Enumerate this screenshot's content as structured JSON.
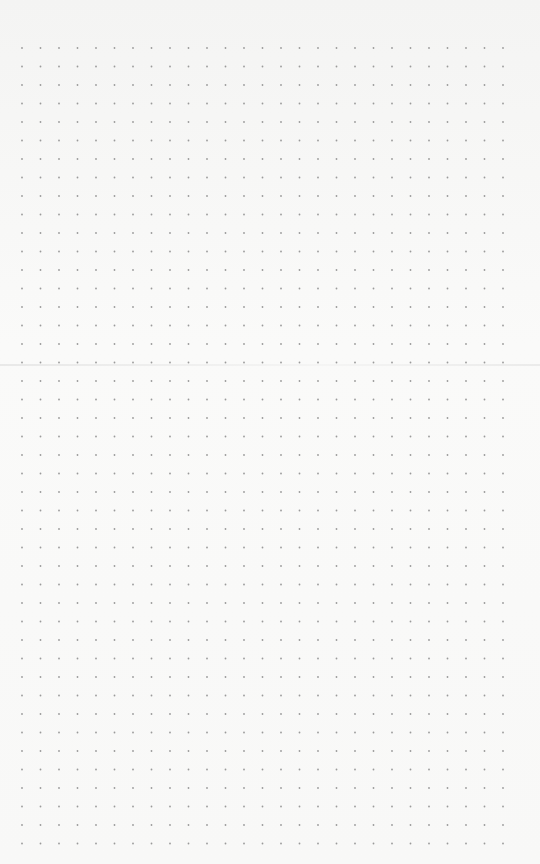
{
  "paper": {
    "type": "dot-grid",
    "background_color": "#f7f7f6",
    "dot_color": "#9a9a9a",
    "columns": 27,
    "rows": 44,
    "origin_x": 22,
    "origin_y": 48,
    "spacing": 18.5,
    "dot_radius": 0.9
  }
}
